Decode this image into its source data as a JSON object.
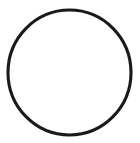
{
  "canvas": {
    "width": 140,
    "height": 143,
    "background_color": "#ffffff",
    "description": "Plain white canvas containing a single hand-drawn style circle outline"
  },
  "figure": {
    "name": "circle-outline",
    "shape_type": "circle",
    "fill": "none",
    "stroke_color": "#1a1a1a",
    "stroke_width_px": 3,
    "center_x": 69.5,
    "center_y": 72.5,
    "radius_x": 61.5,
    "radius_y": 62.5,
    "bounds": {
      "left": 8,
      "top": 10,
      "right": 131,
      "bottom": 135,
      "width": 123,
      "height": 125
    }
  },
  "text": {
    "labels": [],
    "note": ""
  }
}
